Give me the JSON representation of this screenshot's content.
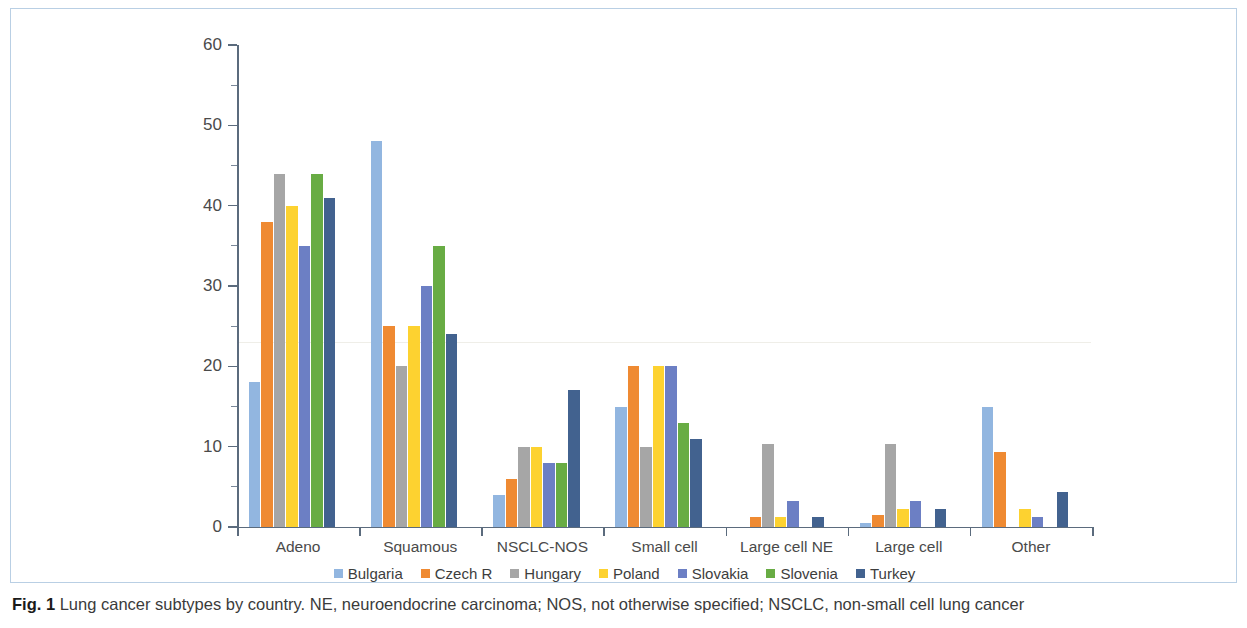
{
  "figure": {
    "caption_label": "Fig. 1",
    "caption_text": "Lung cancer subtypes by country. NE, neuroendocrine carcinoma; NOS, not otherwise specified; NSCLC, non-small cell lung cancer"
  },
  "chart_data": {
    "type": "bar",
    "title": "",
    "xlabel": "",
    "ylabel": "",
    "ylim": [
      0,
      60
    ],
    "yticks": [
      0,
      10,
      20,
      30,
      40,
      50,
      60
    ],
    "ytick_labels": [
      "0",
      "10",
      "20",
      "30",
      "40",
      "50",
      "60"
    ],
    "minor_tick_step": 5,
    "grid": false,
    "legend_position": "bottom",
    "categories": [
      "Adeno",
      "Squamous",
      "NSCLC-NOS",
      "Small cell",
      "Large cell NE",
      "Large cell",
      "Other"
    ],
    "series": [
      {
        "name": "Bulgaria",
        "color": "#92b6e0",
        "values": [
          18,
          48,
          4,
          15,
          0,
          0.5,
          15
        ]
      },
      {
        "name": "Czech R",
        "color": "#ef8a32",
        "values": [
          38,
          25,
          6,
          20,
          1.2,
          1.5,
          9.3
        ]
      },
      {
        "name": "Hungary",
        "color": "#a6a6a6",
        "values": [
          44,
          20,
          10,
          10,
          10.3,
          10.3,
          0
        ]
      },
      {
        "name": "Poland",
        "color": "#fdd230",
        "values": [
          40,
          25,
          10,
          20,
          1.2,
          2.2,
          2.2
        ]
      },
      {
        "name": "Slovakia",
        "color": "#6c7fc4",
        "values": [
          35,
          30,
          8,
          20,
          3.2,
          3.3,
          1.3
        ]
      },
      {
        "name": "Slovenia",
        "color": "#68ac44",
        "values": [
          44,
          35,
          8,
          13,
          0,
          0,
          0
        ]
      },
      {
        "name": "Turkey",
        "color": "#42628f",
        "values": [
          41,
          24,
          17,
          11,
          1.2,
          2.2,
          4.3
        ]
      }
    ]
  }
}
